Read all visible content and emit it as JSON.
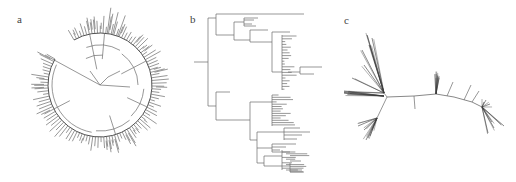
{
  "figure": {
    "background": "#ffffff",
    "line_color": "#6a6a6a",
    "dense_color": "#3a3a3a",
    "panels": [
      {
        "id": "a",
        "label": "a",
        "type": "circular-phylogenetic-tree",
        "label_pos": [
          17,
          14
        ],
        "center": [
          100,
          85
        ],
        "ring_radius": 52,
        "leaf_radius_min": 57,
        "leaf_radius_max": 70,
        "arc_start_deg": -120,
        "arc_end_deg": 210,
        "outgroup_branch": {
          "from": [
            100,
            85
          ],
          "to": [
            45,
            55
          ]
        },
        "leaf_count": 110
      },
      {
        "id": "b",
        "label": "b",
        "type": "rectangular-phylogenetic-tree",
        "label_pos": [
          18,
          14
        ],
        "leaf_count": 72
      },
      {
        "id": "c",
        "label": "c",
        "type": "unrooted-phylogenetic-tree",
        "label_pos": [
          0,
          15
        ],
        "backbone": [
          [
            43,
            97
          ],
          [
            70,
            96
          ],
          [
            92,
            94
          ],
          [
            110,
            97
          ],
          [
            128,
            102
          ],
          [
            138,
            107
          ]
        ],
        "clusters": [
          {
            "name": "upper-left-clade",
            "anchor": [
              40,
              93
            ],
            "rays": [
              [
                23,
                35
              ],
              [
                25,
                45
              ],
              [
                28,
                38
              ],
              [
                18,
                50
              ],
              [
                20,
                65
              ],
              [
                8,
                78
              ],
              [
                0,
                92
              ]
            ]
          },
          {
            "name": "left-clade",
            "anchor": [
              40,
              96
            ],
            "rays": [
              [
                0,
                93
              ],
              [
                4,
                92
              ]
            ]
          },
          {
            "name": "lower-left-clade",
            "anchor": [
              33,
              118
            ],
            "rays": [
              [
                14,
                126
              ],
              [
                20,
                130
              ],
              [
                24,
                138
              ],
              [
                22,
                140
              ],
              [
                26,
                136
              ],
              [
                28,
                130
              ]
            ]
          },
          {
            "name": "mid-tuft",
            "anchor": [
              92,
              94
            ],
            "rays": [
              [
                94,
                76
              ],
              [
                92,
                74
              ],
              [
                95,
                78
              ]
            ]
          },
          {
            "name": "right-clade",
            "anchor": [
              138,
              107
            ],
            "rays": [
              [
                160,
                126
              ],
              [
                144,
                133
              ],
              [
                142,
                100
              ],
              [
                140,
                102
              ],
              [
                146,
                104
              ],
              [
                148,
                122
              ],
              [
                150,
                128
              ]
            ]
          }
        ],
        "side_branches": [
          {
            "from": [
              70,
              96
            ],
            "to": [
              71,
              109
            ]
          },
          {
            "from": [
              103,
              96
            ],
            "to": [
              109,
              82
            ]
          },
          {
            "from": [
              120,
              100
            ],
            "to": [
              127,
              85
            ]
          },
          {
            "from": [
              128,
              102
            ],
            "to": [
              135,
              91
            ]
          }
        ]
      }
    ]
  }
}
